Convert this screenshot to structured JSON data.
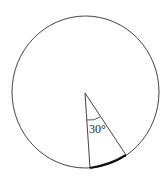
{
  "diagram": {
    "type": "circle-sector",
    "angle_label": "30°",
    "angle_degrees": 30,
    "highlighted": "arc subtended by the 30° central angle",
    "colors": {
      "background": "#ffffff",
      "stroke": "#333333",
      "highlight_arc": "#111111"
    }
  }
}
